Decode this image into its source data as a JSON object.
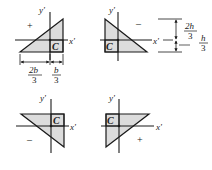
{
  "diagram": {
    "colors": {
      "fill": "#dcdcdc",
      "stroke": "#1a1a1a",
      "background": "#ffffff"
    },
    "panels": [
      {
        "id": "top-left",
        "axis_x_label": "x'",
        "axis_y_label": "y'",
        "centroid_label": "C",
        "sign": "+",
        "dimensions": {
          "left": "2b/3",
          "right": "b/3",
          "left_num": "2b",
          "left_den": "3",
          "right_num": "b",
          "right_den": "3"
        }
      },
      {
        "id": "top-right",
        "axis_x_label": "x'",
        "axis_y_label": "y'",
        "centroid_label": "C",
        "sign": "–",
        "dimensions": {
          "upper": "2h/3",
          "lower": "h/3",
          "upper_num": "2h",
          "upper_den": "3",
          "lower_num": "h",
          "lower_den": "3"
        }
      },
      {
        "id": "bottom-left",
        "axis_x_label": "x'",
        "axis_y_label": "y'",
        "centroid_label": "C",
        "sign": "–"
      },
      {
        "id": "bottom-right",
        "axis_x_label": "x'",
        "axis_y_label": "y'",
        "centroid_label": "C",
        "sign": "+"
      }
    ]
  }
}
